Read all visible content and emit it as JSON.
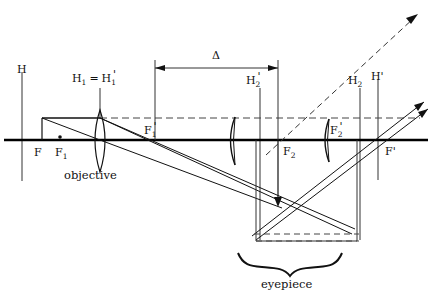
{
  "figure": {
    "type": "optical-ray-diagram",
    "title_visible": false,
    "background_color": "#ffffff",
    "stroke_color": "#111111",
    "width": 433,
    "height": 293
  },
  "labels": {
    "H": "H",
    "H_prime": "H'",
    "H1_equals_H1prime": "H₁ = H₁'",
    "H2_prime": "H₂'",
    "H2": "H₂",
    "F": "F",
    "F1": "F₁",
    "F1_prime": "F₁'",
    "F2": "F₂",
    "F2_prime": "F₂'",
    "F_prime": "F'",
    "delta": "Δ",
    "objective": "objective",
    "eyepiece": "eyepiece"
  },
  "label_parts": {
    "H1_base": "H",
    "H1_sub": "1",
    "equals": "=",
    "H1p_base": "H",
    "H1p_sub": "1",
    "H1p_prime": "'",
    "H2p_base": "H",
    "H2p_sub": "2",
    "H2p_prime": "'",
    "H2_base": "H",
    "H2_sub": "2",
    "F_base": "F",
    "F1_base": "F",
    "F1_sub": "1",
    "F1p_base": "F",
    "F1p_sub": "1",
    "F1p_prime": "'",
    "F2_base": "F",
    "F2_sub": "2",
    "F2p_base": "F",
    "F2p_sub": "2",
    "F2p_prime": "'",
    "Fp_base": "F",
    "Fp_prime": "'",
    "Hp_base": "H",
    "Hp_prime": "'"
  },
  "geometry": {
    "optical_axis_y": 140,
    "optical_axis_x_start": 4,
    "optical_axis_x_end": 428,
    "dashed_ray_level_y": 118,
    "objective_x": 100,
    "eyepiece_field_lens_x": 233,
    "eyepiece_eye_lens_x": 327,
    "H_line_x": 22,
    "H_prime_line_x": 378,
    "F_x": 38,
    "F1_x": 60,
    "F1_prime_x": 155,
    "F2_x": 278,
    "F2_prime_x": 327,
    "F_prime_x": 390,
    "object_x": 42,
    "object_top_y": 118,
    "intermediate_image_x": 278,
    "intermediate_image_y": 205,
    "eyepiece_box_left_x": 238,
    "eyepiece_box_right_x": 352,
    "eyepiece_box_bottom_y": 240,
    "delta_y": 63,
    "delta_from_x": 155,
    "delta_to_x": 278
  },
  "elements": {
    "optical_axis": "horizontal-optical-axis",
    "objective_lens": "biconvex-lens",
    "field_lens": "thin-meniscus-lens",
    "eye_lens": "thin-meniscus-lens",
    "object_arrow": "object-at-left",
    "intermediate_image_arrow": "inverted-intermediate-image",
    "delta_dimension": "optical-tube-length-delta",
    "eyepiece_brace": "curly-brace",
    "exit_rays": "two-parallel-solid-rays-with-arrowheads",
    "construction_ray": "dashed-ray-with-arrowhead"
  }
}
